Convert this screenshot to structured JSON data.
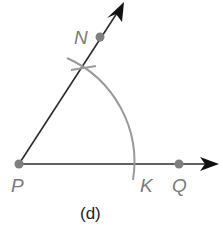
{
  "figure": {
    "caption": "(d)",
    "points": {
      "P": {
        "label": "P",
        "x": 19,
        "y": 164
      },
      "N": {
        "label": "N",
        "x": 100,
        "y": 37
      },
      "Q": {
        "label": "Q",
        "x": 179,
        "y": 164
      },
      "K": {
        "label": "K",
        "x": 133,
        "y": 164
      }
    },
    "rays": [
      {
        "name": "ray-PN",
        "from": "P",
        "through": "N"
      },
      {
        "name": "ray-PQ",
        "from": "P",
        "through": "Q"
      }
    ],
    "arc": {
      "center": "P",
      "radius": 114,
      "intersects": [
        "K",
        "ray-PN"
      ]
    },
    "colors": {
      "line": "#2b2b2b",
      "arc": "#9a9a9a",
      "point": "#7f7f7f",
      "label": "#7a7a7a"
    }
  }
}
